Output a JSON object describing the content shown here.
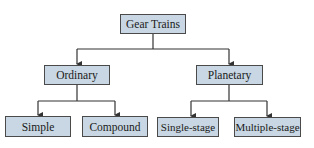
{
  "diagram": {
    "type": "tree",
    "root": {
      "label": "Gear Trains",
      "children": [
        {
          "label": "Ordinary",
          "children": [
            {
              "label": "Simple"
            },
            {
              "label": "Compound"
            }
          ]
        },
        {
          "label": "Planetary",
          "children": [
            {
              "label": "Single-stage"
            },
            {
              "label": "Multiple-stage"
            }
          ]
        }
      ]
    },
    "colors": {
      "node_fill": "#c8d7e3",
      "node_border": "#4a4a4a",
      "edge": "#333333"
    }
  },
  "nodes": {
    "gear_trains": "Gear Trains",
    "ordinary": "Ordinary",
    "planetary": "Planetary",
    "simple": "Simple",
    "compound": "Compound",
    "single_stage": "Single-stage",
    "multiple_stage": "Multiple-stage"
  }
}
